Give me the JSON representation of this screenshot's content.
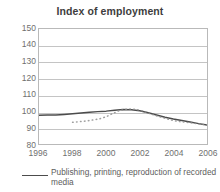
{
  "chart_data": {
    "type": "line",
    "title": "Index of employment",
    "xlabel": "",
    "ylabel": "",
    "xlim": [
      1996,
      2006
    ],
    "ylim": [
      80,
      150
    ],
    "grid": true,
    "legend_position": "bottom",
    "y_ticks": [
      150,
      140,
      130,
      120,
      110,
      100,
      90,
      80
    ],
    "x_ticks": [
      1996,
      1998,
      2000,
      2002,
      2004,
      2006
    ],
    "series": [
      {
        "name": "Publishing, printing, reproduction of recorded media",
        "style": "solid",
        "color": "#4c4c4c",
        "x": [
          1996,
          1996.5,
          1997,
          1997.5,
          1998,
          1998.5,
          1999,
          1999.5,
          2000,
          2000.5,
          2001,
          2001.5,
          2002,
          2002.5,
          2003,
          2003.5,
          2004,
          2004.5,
          2005,
          2005.5,
          2006
        ],
        "values": [
          97.5,
          97.6,
          97.7,
          98.0,
          98.4,
          98.9,
          99.3,
          99.7,
          100.0,
          100.6,
          101.0,
          100.9,
          100.2,
          99.0,
          97.6,
          96.3,
          95.2,
          94.3,
          93.4,
          92.4,
          91.5
        ]
      },
      {
        "name": "secondary-dotted-series",
        "style": "dotted",
        "color": "#8f8f8f",
        "x": [
          1998,
          1998.4,
          1998.8,
          1999.2,
          1999.6,
          2000,
          2000.4,
          2000.8,
          2001.2,
          2001.6,
          2002,
          2002.4,
          2002.8,
          2003.2,
          2003.6,
          2004,
          2004.4,
          2004.8,
          2005.2,
          2005.6,
          2006
        ],
        "values": [
          93.2,
          93.6,
          94.0,
          94.6,
          95.3,
          96.6,
          98.6,
          100.4,
          101.2,
          101.3,
          100.6,
          99.2,
          97.8,
          96.5,
          95.4,
          94.2,
          93.6,
          93.2,
          92.7,
          92.1,
          91.6
        ]
      }
    ]
  },
  "legend": {
    "entries": [
      {
        "label": "Publishing, printing, reproduction of recorded media"
      }
    ]
  },
  "colors": {
    "primary_series": "#4c4c4c",
    "secondary_series": "#8f8f8f",
    "gridline": "#c4c4c4",
    "frame": "#b9b9b9",
    "tick_text": "#6f6f6f",
    "title_text": "#3d3d3d"
  }
}
